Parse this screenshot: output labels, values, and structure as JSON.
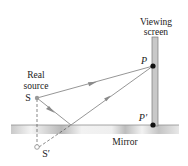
{
  "diagram": {
    "labels": {
      "screen_line1": "Viewing",
      "screen_line2": "screen",
      "source_line1": "Real",
      "source_line2": "source",
      "source": "S",
      "image_source": "S′",
      "point_p": "P",
      "point_p_prime": "P′",
      "mirror": "Mirror"
    },
    "colors": {
      "ray": "#8a8a8a",
      "screen_fill": "#c8c8c8",
      "screen_edge": "#7a7a7a",
      "mirror_light": "#efefef",
      "mirror_dark": "#b5b5b5",
      "point": "#111111",
      "source_point": "#9a9a9a"
    }
  }
}
